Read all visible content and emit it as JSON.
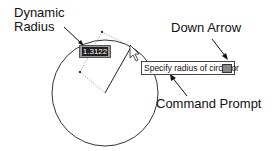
{
  "labels": {
    "dynamic_radius_line1": "Dynamic",
    "dynamic_radius_line2": "Radius",
    "down_arrow": "Down Arrow",
    "command_prompt": "Command Prompt"
  },
  "dynamic_input": {
    "value": "1.3122"
  },
  "prompt": {
    "text": "Specify radius of circle or"
  },
  "colors": {
    "line": "#222222",
    "dotted": "#888888"
  }
}
